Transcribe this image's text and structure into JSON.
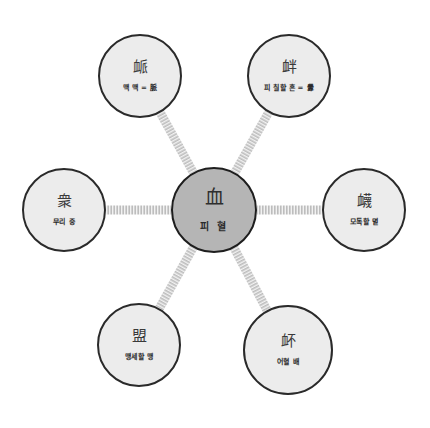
{
  "diagram": {
    "type": "radial-character-map",
    "colors": {
      "background": "#ffffff",
      "node_fill": "#ececec",
      "center_fill": "#b5b5b5",
      "border": "#2a2a2a",
      "connector": "#c4c4c4"
    },
    "center": {
      "hanja": "血",
      "gloss": "피 혈",
      "cx": 214,
      "cy": 210,
      "r": 43
    },
    "nodes": [
      {
        "id": "top-left",
        "hanja": "衇",
        "gloss": "맥 맥 = 脈",
        "cx": 140,
        "cy": 76,
        "r": 42
      },
      {
        "id": "top-right",
        "hanja": "衅",
        "gloss": "피 칠할 흔 = 釁",
        "cx": 289,
        "cy": 76,
        "r": 42
      },
      {
        "id": "left",
        "hanja": "衆",
        "gloss": "무리 중",
        "cx": 64,
        "cy": 210,
        "r": 42
      },
      {
        "id": "right",
        "hanja": "衊",
        "gloss": "모독할 멸",
        "cx": 364,
        "cy": 210,
        "r": 42
      },
      {
        "id": "bottom-left",
        "hanja": "盟",
        "gloss": "맹세할 맹",
        "cx": 139,
        "cy": 345,
        "r": 42
      },
      {
        "id": "bottom-right",
        "hanja": "衃",
        "gloss": "어혈 배",
        "cx": 288,
        "cy": 350,
        "r": 45
      }
    ]
  }
}
